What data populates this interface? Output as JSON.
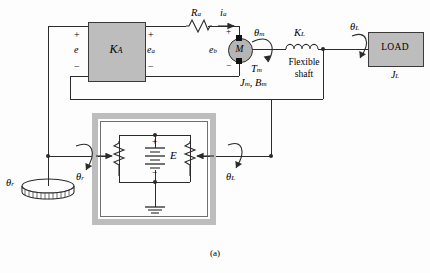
{
  "figure": {
    "caption": "(a)"
  },
  "blocks": {
    "amplifier": {
      "label": "K",
      "sub": "A",
      "name": "amplifier"
    },
    "load": {
      "label": "LOAD",
      "inertia": "J",
      "inertia_sub": "L"
    },
    "motor": {
      "label": "M"
    }
  },
  "labels": {
    "error_voltage": "e",
    "armature_voltage": "e",
    "armature_voltage_sub": "a",
    "armature_resistance": "R",
    "armature_resistance_sub": "a",
    "armature_current": "i",
    "armature_current_sub": "a",
    "back_emf": "e",
    "back_emf_sub": "b",
    "motor_angle": "θ",
    "motor_angle_sub": "m",
    "motor_torque": "T",
    "motor_torque_sub": "m",
    "motor_inertia_damping": "J",
    "motor_inertia_sub": "m",
    "motor_damping": "B",
    "motor_damping_sub": "m",
    "shaft_stiffness": "K",
    "shaft_stiffness_sub": "L",
    "shaft_text_line1": "Flexible",
    "shaft_text_line2": "shaft",
    "load_angle": "θ",
    "load_angle_sub": "L",
    "reference_angle": "θ",
    "reference_angle_sub": "r",
    "supply_voltage": "E",
    "plus": "+",
    "minus": "−"
  },
  "colors": {
    "block_fill": "#bdbdbd",
    "block_stroke": "#3a3a3a",
    "wire": "#2b2b2b",
    "frame": "#bdbdbd",
    "background": "#fdfdfd"
  },
  "icons": {
    "resistor": "resistor-zigzag-icon",
    "inductor": "inductor-coil-icon",
    "battery": "battery-cell-icon",
    "ground": "ground-icon",
    "potentiometer": "potentiometer-icon",
    "dial": "dial-knob-icon",
    "rotation_arrow": "curved-rotation-arrow-icon",
    "junction": "junction-dot-icon"
  }
}
